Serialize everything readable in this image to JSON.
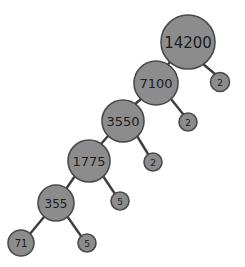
{
  "diagram": {
    "type": "binary-factor-tree",
    "background_color": "#ffffff",
    "node_fill_color": "#8c8c8c",
    "node_stroke_color": "#4a4a4a",
    "edge_color": "#3d3d3d",
    "label_color": "#1c1c1c"
  },
  "nodes": [
    {
      "id": "n14200",
      "label": "14200",
      "cx": 188,
      "cy": 42,
      "r": 27,
      "font_size": 15,
      "role": "root"
    },
    {
      "id": "n2a",
      "label": "2",
      "cx": 220,
      "cy": 82,
      "r": 9.5,
      "font_size": 9,
      "role": "leaf"
    },
    {
      "id": "n7100",
      "label": "7100",
      "cx": 156,
      "cy": 83,
      "r": 22,
      "font_size": 13,
      "role": "internal"
    },
    {
      "id": "n2b",
      "label": "2",
      "cx": 188,
      "cy": 122,
      "r": 9,
      "font_size": 9,
      "role": "leaf"
    },
    {
      "id": "n3550",
      "label": "3550",
      "cx": 123,
      "cy": 121,
      "r": 21,
      "font_size": 13,
      "role": "internal"
    },
    {
      "id": "n2c",
      "label": "2",
      "cx": 153,
      "cy": 162,
      "r": 9,
      "font_size": 9,
      "role": "leaf"
    },
    {
      "id": "n1775",
      "label": "1775",
      "cx": 89,
      "cy": 161,
      "r": 21,
      "font_size": 13,
      "role": "internal"
    },
    {
      "id": "n5a",
      "label": "5",
      "cx": 120,
      "cy": 201,
      "r": 9,
      "font_size": 9,
      "role": "leaf"
    },
    {
      "id": "n355",
      "label": "355",
      "cx": 56,
      "cy": 203,
      "r": 18,
      "font_size": 12,
      "role": "internal"
    },
    {
      "id": "n71",
      "label": "71",
      "cx": 21,
      "cy": 243,
      "r": 13,
      "font_size": 10,
      "role": "leaf"
    },
    {
      "id": "n5b",
      "label": "5",
      "cx": 87,
      "cy": 243,
      "r": 9,
      "font_size": 9,
      "role": "leaf"
    }
  ],
  "edges": [
    {
      "id": "e1",
      "from": "n14200",
      "to": "n7100",
      "x1": 170,
      "y1": 62,
      "x2": 166,
      "y2": 67
    },
    {
      "id": "e2",
      "from": "n14200",
      "to": "n2a",
      "x1": 203,
      "y1": 64,
      "x2": 215,
      "y2": 74
    },
    {
      "id": "e3",
      "from": "n7100",
      "to": "n3550",
      "x1": 141,
      "y1": 99,
      "x2": 134,
      "y2": 105
    },
    {
      "id": "e4",
      "from": "n7100",
      "to": "n2b",
      "x1": 171,
      "y1": 99,
      "x2": 183,
      "y2": 114
    },
    {
      "id": "e5",
      "from": "n3550",
      "to": "n1775",
      "x1": 108,
      "y1": 136,
      "x2": 101,
      "y2": 144
    },
    {
      "id": "e6",
      "from": "n3550",
      "to": "n2c",
      "x1": 137,
      "y1": 136,
      "x2": 148,
      "y2": 154
    },
    {
      "id": "e7",
      "from": "n1775",
      "to": "n355",
      "x1": 75,
      "y1": 176,
      "x2": 66,
      "y2": 189
    },
    {
      "id": "e8",
      "from": "n1775",
      "to": "n5a",
      "x1": 103,
      "y1": 176,
      "x2": 115,
      "y2": 194
    },
    {
      "id": "e9",
      "from": "n355",
      "to": "n71",
      "x1": 44,
      "y1": 217,
      "x2": 29,
      "y2": 235
    },
    {
      "id": "e10",
      "from": "n355",
      "to": "n5b",
      "x1": 67,
      "y1": 216,
      "x2": 81,
      "y2": 236
    }
  ]
}
